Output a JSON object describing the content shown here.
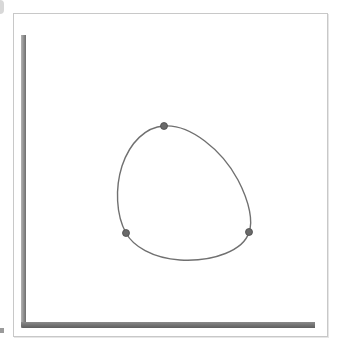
{
  "diagram": {
    "type": "closed-spline-through-points",
    "colors": {
      "curve": "#707070",
      "point_fill": "#6a6a6a",
      "point_stroke": "#4a4a4a",
      "axis": "#6e6e6e",
      "frame": "#c8c8c8"
    },
    "control_points": [
      {
        "label": "top",
        "x": 164,
        "y": 126
      },
      {
        "label": "left",
        "x": 126,
        "y": 233
      },
      {
        "label": "right",
        "x": 249,
        "y": 232
      }
    ]
  }
}
